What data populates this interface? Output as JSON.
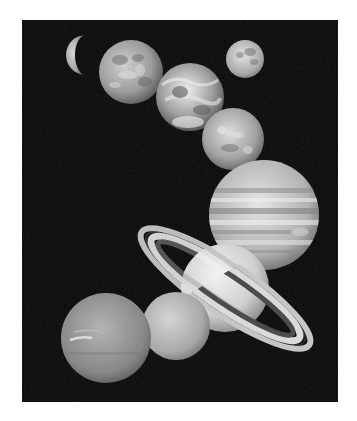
{
  "image": {
    "subject": "Solar system planets montage (grayscale)",
    "background_color": "#070707",
    "page_background": "#ffffff"
  },
  "bodies": [
    {
      "name": "Mercury",
      "cx": 82,
      "cy": 55,
      "r": 20,
      "shade": "#b8b8b8",
      "phase": "crescent"
    },
    {
      "name": "Venus",
      "cx": 131,
      "cy": 72,
      "r": 32,
      "shade": "#a9a9a9"
    },
    {
      "name": "Moon",
      "cx": 245,
      "cy": 59,
      "r": 19,
      "shade": "#bdbdbd"
    },
    {
      "name": "Earth",
      "cx": 190,
      "cy": 97,
      "r": 34,
      "shade": "#c8c8c8"
    },
    {
      "name": "Mars",
      "cx": 233,
      "cy": 139,
      "r": 31,
      "shade": "#b0b0b0"
    },
    {
      "name": "Jupiter",
      "cx": 264,
      "cy": 215,
      "r": 55,
      "shade": "#c4c4c4"
    },
    {
      "name": "Saturn",
      "cx": 225,
      "cy": 288,
      "r": 44,
      "shade": "#d6d6d6",
      "ring": {
        "rx": 101,
        "ry": 25,
        "angle": 34
      }
    },
    {
      "name": "Uranus",
      "cx": 176,
      "cy": 326,
      "r": 34,
      "shade": "#b4b4b4"
    },
    {
      "name": "Neptune",
      "cx": 106,
      "cy": 338,
      "r": 45,
      "shade": "#8f8f8f"
    }
  ]
}
